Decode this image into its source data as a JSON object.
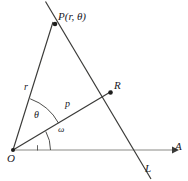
{
  "figure": {
    "type": "geometry-diagram",
    "colors": {
      "stroke": "#3a3a38",
      "axis": "#7d7d79",
      "label": "#20201f",
      "background": "#ffffff"
    },
    "points": [
      {
        "id": "O",
        "label": "O",
        "x": 13,
        "y": 150
      },
      {
        "id": "P",
        "label": "P(r, θ)",
        "x": 55,
        "y": 24
      },
      {
        "id": "R",
        "label": "R",
        "x": 110,
        "y": 93
      }
    ],
    "segments": [
      {
        "id": "OP",
        "label": "r",
        "from": "O",
        "to": "P"
      },
      {
        "id": "OR",
        "label": "p",
        "from": "O",
        "to": "R"
      }
    ],
    "angles": [
      {
        "id": "theta",
        "label": "θ",
        "between": "OR-to-OP"
      },
      {
        "id": "omega",
        "label": "ω",
        "between": "OA-to-OR"
      }
    ],
    "rays": [
      {
        "id": "OA",
        "label": "A",
        "description": "horizontal polar axis with arrowhead"
      }
    ],
    "lines": [
      {
        "id": "L",
        "label": "L",
        "description": "line through P and R"
      }
    ],
    "labels": {
      "point_P": "P(r, θ)",
      "point_R": "R",
      "point_O": "O",
      "segment_r": "r",
      "segment_p": "p",
      "angle_theta": "θ",
      "angle_omega": "ω",
      "axis_A": "A",
      "line_L": "L"
    }
  }
}
